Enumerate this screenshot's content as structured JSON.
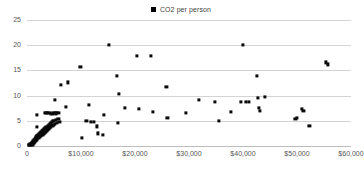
{
  "chart_data": {
    "type": "scatter",
    "title": "",
    "subtitle": "",
    "xlabel": "",
    "ylabel": "",
    "xlim": [
      0,
      60000
    ],
    "ylim": [
      0,
      25
    ],
    "grid": true,
    "legend_position": "top-center",
    "marker": {
      "shape": "square",
      "color": "#0a0a0a",
      "size_px": 3.2
    },
    "legend": [
      {
        "label": "CO2 per person",
        "marker_color": "#0a0a0a",
        "marker_shape": "square"
      }
    ],
    "axes": {
      "y": {
        "ticks": [
          0,
          5,
          10,
          15,
          20,
          25
        ],
        "tick_labels": [
          "0",
          "5",
          "10",
          "15",
          "20",
          "25"
        ],
        "min": 0,
        "max": 25
      },
      "x": {
        "ticks": [
          0,
          10000,
          20000,
          30000,
          40000,
          50000,
          60000
        ],
        "tick_labels": [
          "0",
          "$10,000",
          "$20,000",
          "$30,000",
          "$40,000",
          "$50,000",
          "$60,000"
        ],
        "min": 0,
        "max": 60000
      }
    },
    "series": [
      {
        "name": "CO2 per person",
        "points": [
          [
            300,
            0.2
          ],
          [
            450,
            0.25
          ],
          [
            600,
            0.3
          ],
          [
            700,
            0.15
          ],
          [
            800,
            0.35
          ],
          [
            900,
            0.5
          ],
          [
            950,
            0.2
          ],
          [
            1000,
            0.6
          ],
          [
            1050,
            0.4
          ],
          [
            1100,
            0.75
          ],
          [
            1150,
            0.3
          ],
          [
            1200,
            0.9
          ],
          [
            1250,
            0.55
          ],
          [
            1300,
            1.1
          ],
          [
            1350,
            0.7
          ],
          [
            1400,
            1.25
          ],
          [
            1450,
            0.85
          ],
          [
            1500,
            1.4
          ],
          [
            1550,
            1.0
          ],
          [
            1600,
            1.6
          ],
          [
            1650,
            1.15
          ],
          [
            1700,
            1.75
          ],
          [
            1750,
            1.3
          ],
          [
            1800,
            1.9
          ],
          [
            1850,
            1.45
          ],
          [
            1900,
            2.05
          ],
          [
            1950,
            1.55
          ],
          [
            2000,
            2.2
          ],
          [
            2100,
            1.7
          ],
          [
            2200,
            2.4
          ],
          [
            2300,
            1.85
          ],
          [
            2400,
            2.55
          ],
          [
            2500,
            2.0
          ],
          [
            2600,
            2.7
          ],
          [
            2700,
            2.15
          ],
          [
            2800,
            2.9
          ],
          [
            2900,
            2.3
          ],
          [
            3000,
            3.1
          ],
          [
            3100,
            2.45
          ],
          [
            3200,
            3.3
          ],
          [
            3300,
            2.6
          ],
          [
            3400,
            3.5
          ],
          [
            3500,
            2.8
          ],
          [
            3600,
            3.7
          ],
          [
            3700,
            3.0
          ],
          [
            3800,
            3.9
          ],
          [
            3900,
            3.2
          ],
          [
            4000,
            4.1
          ],
          [
            4100,
            3.4
          ],
          [
            4200,
            4.3
          ],
          [
            4300,
            3.55
          ],
          [
            4400,
            4.5
          ],
          [
            4500,
            3.75
          ],
          [
            4600,
            4.7
          ],
          [
            4700,
            3.95
          ],
          [
            4800,
            4.9
          ],
          [
            4900,
            4.15
          ],
          [
            5000,
            5.0
          ],
          [
            5200,
            4.35
          ],
          [
            5400,
            5.2
          ],
          [
            5600,
            4.55
          ],
          [
            5800,
            5.4
          ],
          [
            6000,
            4.75
          ],
          [
            1800,
            6.2
          ],
          [
            1900,
            3.8
          ],
          [
            3400,
            6.5
          ],
          [
            3600,
            6.6
          ],
          [
            3900,
            6.5
          ],
          [
            4200,
            6.55
          ],
          [
            4500,
            6.3
          ],
          [
            4800,
            6.45
          ],
          [
            5100,
            6.5
          ],
          [
            5400,
            6.45
          ],
          [
            5600,
            6.55
          ],
          [
            5900,
            6.5
          ],
          [
            5200,
            9.2
          ],
          [
            6300,
            12.1
          ],
          [
            7500,
            12.6
          ],
          [
            7200,
            7.8
          ],
          [
            9900,
            15.7
          ],
          [
            10200,
            1.6
          ],
          [
            11500,
            8.2
          ],
          [
            11000,
            4.9
          ],
          [
            11800,
            4.7
          ],
          [
            12400,
            4.8
          ],
          [
            12900,
            3.9
          ],
          [
            13200,
            2.5
          ],
          [
            14000,
            2.2
          ],
          [
            14300,
            6.2
          ],
          [
            15200,
            20.1
          ],
          [
            16700,
            13.9
          ],
          [
            17000,
            10.3
          ],
          [
            16900,
            4.6
          ],
          [
            18200,
            7.5
          ],
          [
            20300,
            17.9
          ],
          [
            20700,
            7.3
          ],
          [
            22900,
            17.8
          ],
          [
            23300,
            6.7
          ],
          [
            25800,
            11.7
          ],
          [
            26000,
            5.6
          ],
          [
            29500,
            6.6
          ],
          [
            31800,
            9.1
          ],
          [
            34800,
            8.8
          ],
          [
            35600,
            4.9
          ],
          [
            37800,
            6.8
          ],
          [
            39600,
            8.7
          ],
          [
            40000,
            20.1
          ],
          [
            40600,
            8.7
          ],
          [
            41100,
            8.8
          ],
          [
            42600,
            13.9
          ],
          [
            42800,
            9.6
          ],
          [
            42900,
            7.6
          ],
          [
            43100,
            6.9
          ],
          [
            44000,
            9.7
          ],
          [
            49700,
            5.3
          ],
          [
            50000,
            5.5
          ],
          [
            50900,
            7.4
          ],
          [
            51200,
            7.0
          ],
          [
            52300,
            4.0
          ],
          [
            55300,
            16.6
          ],
          [
            55700,
            16.2
          ]
        ]
      }
    ]
  }
}
